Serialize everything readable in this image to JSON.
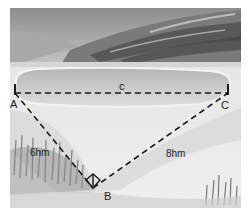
{
  "figure": {
    "type": "watercolor-illustration",
    "points": {
      "A": {
        "label": "A"
      },
      "B": {
        "label": "B"
      },
      "C": {
        "label": "C"
      }
    },
    "segments": {
      "AC": {
        "label": "c",
        "style": "dashed"
      },
      "AB": {
        "label": "6hm",
        "style": "dashed"
      },
      "BC": {
        "label": "8hm",
        "style": "dashed"
      }
    },
    "right_angle_at": "B",
    "colors": {
      "sky": "#9a9a9a",
      "hills": "#5e5e5e",
      "lake": "#c9c9c9",
      "ground": "#e6e6e6",
      "line": "#1a1a1a"
    }
  }
}
